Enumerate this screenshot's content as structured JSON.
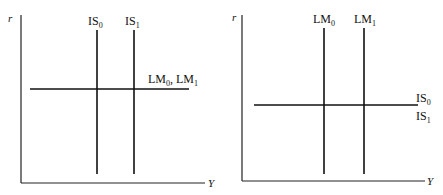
{
  "panels": [
    {
      "id": "left",
      "y_axis_label": "r",
      "x_axis_label": "Y",
      "vertical_curves": [
        {
          "name": "IS",
          "sub": "0"
        },
        {
          "name": "IS",
          "sub": "1"
        }
      ],
      "horizontal_curve_label": {
        "parts": [
          {
            "name": "LM",
            "sub": "0"
          },
          {
            "name": ", LM",
            "sub": "1"
          }
        ]
      }
    },
    {
      "id": "right",
      "y_axis_label": "r",
      "x_axis_label": "Y",
      "vertical_curves": [
        {
          "name": "LM",
          "sub": "0"
        },
        {
          "name": "LM",
          "sub": "1"
        }
      ],
      "horizontal_curve_labels": [
        {
          "name": "IS",
          "sub": "0"
        },
        {
          "name": "IS",
          "sub": "1"
        }
      ]
    }
  ]
}
